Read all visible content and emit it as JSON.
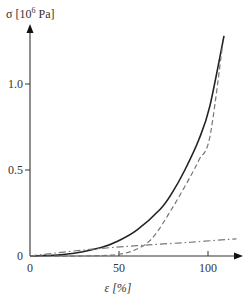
{
  "chart_data": {
    "type": "line",
    "title": "",
    "ylabel": "σ [10⁶ Pa]",
    "ylabel_main": "σ [10",
    "ylabel_exp": "6",
    "ylabel_unit": " Pa]",
    "xlabel": "ε [%]",
    "xlim": [
      0,
      118
    ],
    "ylim": [
      0,
      1.3
    ],
    "x_ticks": [
      "0",
      "50",
      "100"
    ],
    "y_ticks": [
      "0",
      "0.5",
      "1.0"
    ],
    "grid": false,
    "legend": "none",
    "series": [
      {
        "name": "solid",
        "style": "solid",
        "color": "#222222",
        "x": [
          0,
          20,
          40,
          50,
          60,
          73,
          80,
          87,
          95,
          101,
          109
        ],
        "y": [
          0,
          0.01,
          0.05,
          0.09,
          0.15,
          0.27,
          0.37,
          0.5,
          0.68,
          0.87,
          1.28
        ]
      },
      {
        "name": "dashed",
        "style": "dashed",
        "color": "#777777",
        "x": [
          0,
          30,
          50,
          62,
          70,
          80,
          90,
          95,
          101,
          108
        ],
        "y": [
          0,
          0.0,
          0.01,
          0.05,
          0.12,
          0.28,
          0.46,
          0.56,
          0.69,
          1.21
        ]
      },
      {
        "name": "dash-dot",
        "style": "dash-dot",
        "color": "#777777",
        "x": [
          0,
          30,
          60,
          90,
          116
        ],
        "y": [
          0,
          0.035,
          0.06,
          0.08,
          0.1
        ]
      }
    ]
  }
}
